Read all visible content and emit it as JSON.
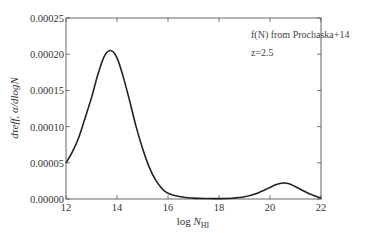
{
  "chart_data": {
    "type": "line",
    "title": "",
    "xlabel": "log N_HI",
    "ylabel": "dτ_eff,α / dlogN",
    "xlim": [
      12,
      22
    ],
    "ylim": [
      0.0,
      0.00025
    ],
    "grid": false,
    "x_ticks": [
      12,
      14,
      16,
      18,
      20,
      22
    ],
    "y_ticks": [
      "0.00000",
      "0.00005",
      "0.00010",
      "0.00015",
      "0.00020",
      "0.00025"
    ],
    "annotations": [
      "f(N) from Prochaska+14",
      "z=2.5"
    ],
    "series": [
      {
        "name": "f(N) from Prochaska+14, z=2.5",
        "x": [
          12.0,
          12.25,
          12.5,
          12.75,
          13.0,
          13.25,
          13.5,
          13.75,
          14.0,
          14.25,
          14.5,
          14.75,
          15.0,
          15.25,
          15.5,
          15.75,
          16.0,
          16.5,
          17.0,
          17.5,
          18.0,
          18.5,
          19.0,
          19.5,
          20.0,
          20.25,
          20.5,
          20.75,
          21.0,
          21.5,
          22.0
        ],
        "y": [
          5e-05,
          6.5e-05,
          8.5e-05,
          0.000112,
          0.00014,
          0.000172,
          0.000197,
          0.000205,
          0.000195,
          0.000168,
          0.000135,
          0.0001,
          7e-05,
          4.5e-05,
          2.7e-05,
          1.5e-05,
          8e-06,
          3e-06,
          1.2e-06,
          6e-07,
          5e-07,
          1e-06,
          3e-06,
          8e-06,
          1.6e-05,
          2e-05,
          2.2e-05,
          2.1e-05,
          1.7e-05,
          8e-06,
          1e-06
        ]
      }
    ]
  },
  "axes": {
    "x_label_main": "log N",
    "x_label_sub": "HI",
    "y_label": "dτeff, α/dlogN"
  }
}
